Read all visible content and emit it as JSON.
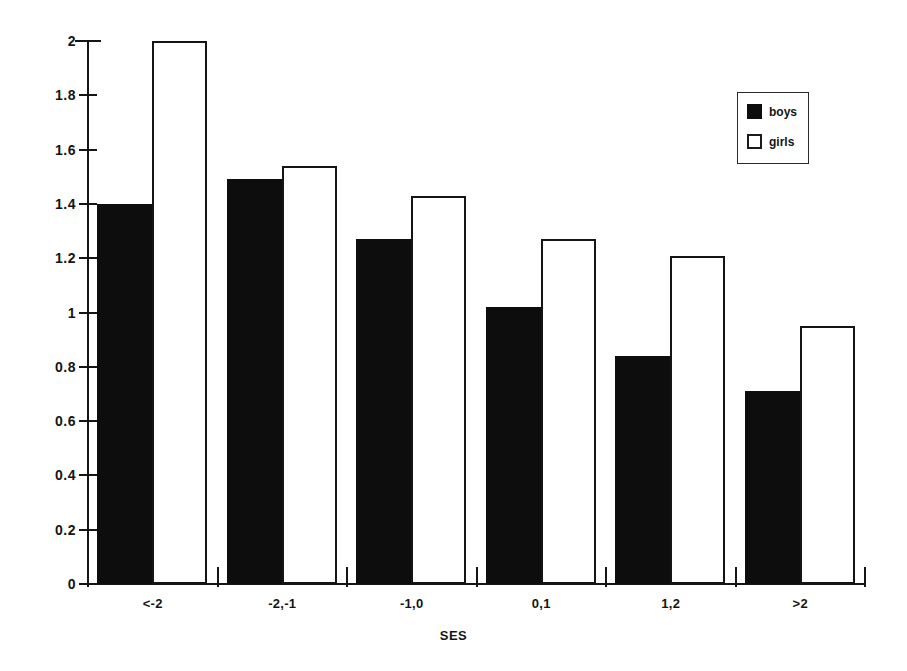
{
  "chart_data": {
    "type": "bar",
    "title": "",
    "xlabel": "SES",
    "ylabel": "",
    "categories": [
      "<-2",
      "-2,-1",
      "-1,0",
      "0,1",
      "1,2",
      ">2"
    ],
    "series": [
      {
        "name": "boys",
        "color": "#0d0d0d",
        "values": [
          1.4,
          1.49,
          1.27,
          1.02,
          0.84,
          0.71
        ]
      },
      {
        "name": "girls",
        "color": "#ffffff",
        "values": [
          2.0,
          1.54,
          1.43,
          1.27,
          1.21,
          0.95
        ]
      }
    ],
    "ylim": [
      0,
      2
    ],
    "ytick_labels": [
      "0",
      "0.2",
      "0.4",
      "0.6",
      "0.8",
      "1",
      "1.2",
      "1.4",
      "1.6",
      "1.8",
      "2"
    ],
    "ytick_values": [
      0,
      0.2,
      0.4,
      0.6,
      0.8,
      1,
      1.2,
      1.4,
      1.6,
      1.8,
      2
    ],
    "grid": false,
    "legend_position": "top-right",
    "legend_entries": [
      "boys",
      "girls"
    ]
  }
}
